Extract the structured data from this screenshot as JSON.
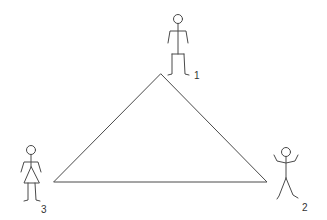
{
  "diagram": {
    "type": "triangle-with-stick-figures",
    "colors": {
      "stroke": "#4a4a4a",
      "background": "#ffffff",
      "label": "#333333"
    },
    "triangle": {
      "vertices": [
        [
          161,
          74
        ],
        [
          267,
          182
        ],
        [
          54,
          182
        ]
      ]
    },
    "figures": [
      {
        "id": 1,
        "label": "1",
        "pose": "standing-arms-down",
        "position": "top"
      },
      {
        "id": 2,
        "label": "2",
        "pose": "arms-raised",
        "position": "bottom-right"
      },
      {
        "id": 3,
        "label": "3",
        "pose": "standing-skirt",
        "position": "bottom-left"
      }
    ]
  }
}
